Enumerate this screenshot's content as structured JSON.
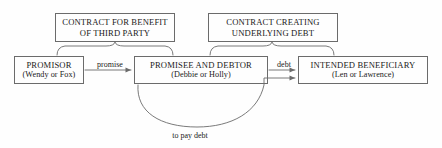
{
  "diagram": {
    "stroke_color": "#6b6b6b",
    "text_color": "#1a1a1a",
    "background_color": "#fefefe",
    "top_boxes": [
      {
        "id": "contract-for-benefit-of-third-party",
        "line1": "CONTRACT FOR BENEFIT",
        "line2": "OF THIRD PARTY"
      },
      {
        "id": "contract-creating-underlying-debt",
        "line1": "CONTRACT CREATING",
        "line2": "UNDERLYING DEBT"
      }
    ],
    "party_boxes": [
      {
        "id": "promisor",
        "role": "PROMISOR",
        "names": "(Wendy or Fox)"
      },
      {
        "id": "promisee-and-debtor",
        "role": "PROMISEE AND DEBTOR",
        "names": "(Debbie or Holly)"
      },
      {
        "id": "intended-beneficiary",
        "role": "INTENDED BENEFICIARY",
        "names": "(Len or Lawrence)"
      }
    ],
    "edges": [
      {
        "id": "promisor-to-promisee",
        "label": "promise",
        "from": "promisor",
        "to": "promisee-and-debtor"
      },
      {
        "id": "promisee-to-beneficiary",
        "label": "debt",
        "from": "promisee-and-debtor",
        "to": "intended-beneficiary"
      },
      {
        "id": "promisee-to-beneficiary-payment",
        "label": "to pay debt",
        "from": "promisee-and-debtor",
        "to": "intended-beneficiary"
      }
    ]
  }
}
